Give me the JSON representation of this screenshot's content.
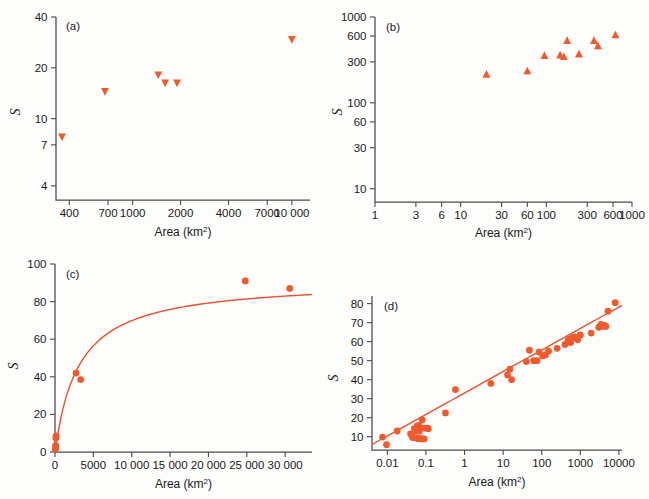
{
  "figure": {
    "axis_title": "Area (km",
    "axis_title_sup": "2",
    "axis_title_close": ")",
    "y_axis_label": "S",
    "marker_color": "#ef5a2e",
    "line_color": "#e8512c",
    "axis_color": "#4a4a4a"
  },
  "chart_data": [
    {
      "id": "a",
      "panel_label": "(a)",
      "type": "scatter",
      "marker": "triangle-down",
      "xscale": "log",
      "yscale": "log",
      "xlabel": "Area (km2)",
      "ylabel": "S",
      "xticks": [
        400,
        700,
        1000,
        2000,
        4000,
        7000,
        10000
      ],
      "xticklabels": [
        "400",
        "700",
        "1000",
        "2000",
        "4000",
        "7000",
        "10 000"
      ],
      "yticks": [
        4,
        7,
        10,
        20,
        40
      ],
      "yticklabels": [
        "4",
        "7",
        "10",
        "20",
        "40"
      ],
      "xlim": [
        330,
        13000
      ],
      "ylim": [
        3.3,
        40
      ],
      "points": [
        {
          "x": 360,
          "y": 7.8
        },
        {
          "x": 670,
          "y": 14.5
        },
        {
          "x": 1450,
          "y": 18.2
        },
        {
          "x": 1600,
          "y": 16.3
        },
        {
          "x": 1900,
          "y": 16.3
        },
        {
          "x": 10000,
          "y": 29.5
        }
      ]
    },
    {
      "id": "b",
      "panel_label": "(b)",
      "type": "scatter",
      "marker": "triangle-up",
      "xscale": "log",
      "yscale": "log",
      "xlabel": "Area (km2)",
      "ylabel": "S",
      "xticks": [
        1,
        3,
        6,
        10,
        30,
        60,
        100,
        300,
        600,
        1000
      ],
      "xticklabels": [
        "1",
        "3",
        "6",
        "10",
        "30",
        "60",
        "100",
        "300",
        "600",
        "1000"
      ],
      "yticks": [
        10,
        30,
        60,
        100,
        300,
        600,
        1000
      ],
      "yticklabels": [
        "10",
        "30",
        "60",
        "100",
        "300",
        "600",
        "1000"
      ],
      "xlim": [
        1,
        1000
      ],
      "ylim": [
        7,
        1000
      ],
      "points": [
        {
          "x": 20,
          "y": 215
        },
        {
          "x": 60,
          "y": 235
        },
        {
          "x": 95,
          "y": 355
        },
        {
          "x": 145,
          "y": 360
        },
        {
          "x": 160,
          "y": 345
        },
        {
          "x": 175,
          "y": 530
        },
        {
          "x": 240,
          "y": 370
        },
        {
          "x": 360,
          "y": 530
        },
        {
          "x": 400,
          "y": 460
        },
        {
          "x": 640,
          "y": 620
        }
      ]
    },
    {
      "id": "c",
      "panel_label": "(c)",
      "type": "scatter",
      "marker": "circle",
      "xscale": "linear",
      "yscale": "linear",
      "xlabel": "Area (km2)",
      "ylabel": "S",
      "xticks": [
        0,
        5000,
        10000,
        15000,
        20000,
        25000,
        30000
      ],
      "xticklabels": [
        "0",
        "5000",
        "10 000",
        "15 000",
        "20 000",
        "25 000",
        "30 000"
      ],
      "yticks": [
        0,
        20,
        40,
        60,
        80,
        100
      ],
      "yticklabels": [
        "0",
        "20",
        "40",
        "60",
        "80",
        "100"
      ],
      "xlim": [
        0,
        33500
      ],
      "ylim": [
        0,
        100
      ],
      "fit": {
        "type": "saturating",
        "asymptote": 91.5,
        "halfsat": 3100
      },
      "points": [
        {
          "x": 60,
          "y": 1.5
        },
        {
          "x": 70,
          "y": 2.5
        },
        {
          "x": 90,
          "y": 3.5
        },
        {
          "x": 120,
          "y": 7.5
        },
        {
          "x": 150,
          "y": 8.5
        },
        {
          "x": 2750,
          "y": 42.0
        },
        {
          "x": 3350,
          "y": 38.5
        },
        {
          "x": 24800,
          "y": 91.0
        },
        {
          "x": 30600,
          "y": 87.0
        }
      ]
    },
    {
      "id": "d",
      "panel_label": "(d)",
      "type": "scatter",
      "marker": "circle",
      "xscale": "log",
      "yscale": "linear",
      "xlabel": "Area (km2)",
      "ylabel": "S",
      "xticks": [
        0.01,
        0.1,
        1,
        10,
        100,
        1000,
        10000
      ],
      "xticklabels": [
        "0.01",
        "0.1",
        "1",
        "10",
        "100",
        "1000",
        "10000"
      ],
      "yticks": [
        10,
        20,
        30,
        40,
        50,
        60,
        70,
        80
      ],
      "yticklabels": [
        "10",
        "20",
        "30",
        "40",
        "50",
        "60",
        "70",
        "80"
      ],
      "xlim": [
        0.004,
        12000
      ],
      "ylim": [
        3,
        84
      ],
      "fit": {
        "type": "loglinear",
        "intercept": 33.0,
        "slope": 11.3
      },
      "points": [
        {
          "x": 0.0075,
          "y": 9.8
        },
        {
          "x": 0.0095,
          "y": 5.8
        },
        {
          "x": 0.018,
          "y": 13.0
        },
        {
          "x": 0.04,
          "y": 11.5
        },
        {
          "x": 0.044,
          "y": 10.0
        },
        {
          "x": 0.047,
          "y": 9.5
        },
        {
          "x": 0.05,
          "y": 14.2
        },
        {
          "x": 0.052,
          "y": 13.6
        },
        {
          "x": 0.055,
          "y": 12.8
        },
        {
          "x": 0.058,
          "y": 15.5
        },
        {
          "x": 0.06,
          "y": 9.0
        },
        {
          "x": 0.062,
          "y": 9.2
        },
        {
          "x": 0.065,
          "y": 16.0
        },
        {
          "x": 0.068,
          "y": 13.0
        },
        {
          "x": 0.072,
          "y": 9.0
        },
        {
          "x": 0.075,
          "y": 8.8
        },
        {
          "x": 0.08,
          "y": 18.8
        },
        {
          "x": 0.085,
          "y": 14.5
        },
        {
          "x": 0.09,
          "y": 8.8
        },
        {
          "x": 0.11,
          "y": 14.5
        },
        {
          "x": 0.115,
          "y": 14.2
        },
        {
          "x": 0.32,
          "y": 22.5
        },
        {
          "x": 0.58,
          "y": 34.8
        },
        {
          "x": 4.8,
          "y": 38.0
        },
        {
          "x": 13.0,
          "y": 42.5
        },
        {
          "x": 15.0,
          "y": 45.5
        },
        {
          "x": 16.5,
          "y": 40.0
        },
        {
          "x": 40.0,
          "y": 49.5
        },
        {
          "x": 48.0,
          "y": 55.5
        },
        {
          "x": 62.0,
          "y": 50.0
        },
        {
          "x": 75.0,
          "y": 50.0
        },
        {
          "x": 85.0,
          "y": 54.5
        },
        {
          "x": 105.0,
          "y": 52.5
        },
        {
          "x": 125.0,
          "y": 53.0
        },
        {
          "x": 150.0,
          "y": 55.0
        },
        {
          "x": 250.0,
          "y": 56.5
        },
        {
          "x": 400.0,
          "y": 58.5
        },
        {
          "x": 480.0,
          "y": 60.5
        },
        {
          "x": 520.0,
          "y": 61.5
        },
        {
          "x": 560.0,
          "y": 59.5
        },
        {
          "x": 620.0,
          "y": 62.0
        },
        {
          "x": 700.0,
          "y": 62.5
        },
        {
          "x": 850.0,
          "y": 61.0
        },
        {
          "x": 1000.0,
          "y": 63.5
        },
        {
          "x": 1900.0,
          "y": 64.5
        },
        {
          "x": 3000.0,
          "y": 67.5
        },
        {
          "x": 3400.0,
          "y": 69.0
        },
        {
          "x": 3800.0,
          "y": 68.0
        },
        {
          "x": 4200.0,
          "y": 68.5
        },
        {
          "x": 4600.0,
          "y": 68.0
        },
        {
          "x": 5200.0,
          "y": 76.0
        },
        {
          "x": 8000.0,
          "y": 80.5
        }
      ]
    }
  ]
}
